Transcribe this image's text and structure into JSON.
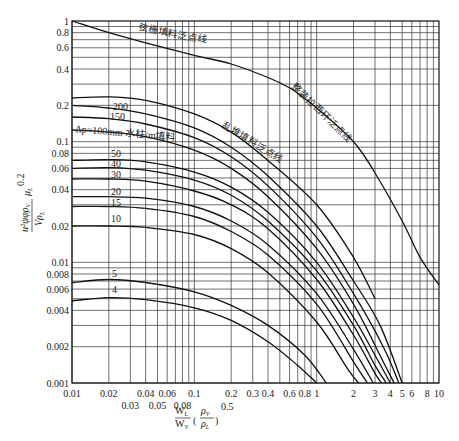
{
  "chart_data": {
    "type": "line",
    "title": "",
    "xscale": "log",
    "yscale": "log",
    "xlim": [
      0.01,
      10
    ],
    "ylim": [
      0.001,
      1
    ],
    "grid": true,
    "xlabel": "W_L/W_V (ρ_V/ρ_L)^0.5",
    "ylabel": "u²ψφρ_V/(gρ_L) μ_L^0.2",
    "x_ticks": [
      0.01,
      0.02,
      0.03,
      0.04,
      0.05,
      0.06,
      0.08,
      0.1,
      0.2,
      0.3,
      0.4,
      0.6,
      0.8,
      1,
      2,
      3,
      4,
      5,
      6,
      8,
      10
    ],
    "x_tick_labels": [
      "0.01",
      "0.02",
      "0.03",
      "0.04",
      "0.05",
      "0.06",
      "0.08",
      "0.1",
      "0.2",
      "0.3",
      "0.4",
      "0.6",
      "0.8",
      "1",
      "2",
      "3",
      "4",
      "5",
      "6",
      "8",
      "10"
    ],
    "y_ticks": [
      1,
      0.8,
      0.6,
      0.4,
      0.2,
      0.1,
      0.08,
      0.06,
      0.04,
      0.02,
      0.01,
      0.008,
      0.006,
      0.004,
      0.002,
      0.001
    ],
    "y_tick_labels": [
      "1",
      "0.8",
      "0.6",
      "0.4",
      "0.2",
      "0.1",
      "0.08",
      "0.06",
      "0.04",
      "0.02",
      "0.01",
      "0.008",
      "0.006",
      "0.004",
      "0.002",
      "0.001"
    ],
    "series": [
      {
        "name": "弦栅填料泛点线",
        "label_text": "弦栅填料泛点线",
        "points": [
          [
            0.01,
            1.0
          ],
          [
            0.02,
            0.8
          ],
          [
            0.04,
            0.66
          ],
          [
            0.1,
            0.52
          ],
          [
            0.2,
            0.44
          ],
          [
            0.4,
            0.34
          ],
          [
            0.6,
            0.28
          ],
          [
            0.75,
            0.24
          ]
        ]
      },
      {
        "name": "整装拉西环泛点线",
        "label_text": "整装拉西环泛点线",
        "points": [
          [
            0.7,
            0.25
          ],
          [
            1,
            0.19
          ],
          [
            2,
            0.1
          ],
          [
            3,
            0.055
          ],
          [
            5,
            0.022
          ],
          [
            7,
            0.011
          ],
          [
            10,
            0.0065
          ]
        ]
      },
      {
        "name": "乱堆填料泛点线",
        "label_text": "乱堆填料泛点线",
        "points": [
          [
            0.01,
            0.23
          ],
          [
            0.02,
            0.235
          ],
          [
            0.04,
            0.22
          ],
          [
            0.1,
            0.17
          ],
          [
            0.2,
            0.12
          ],
          [
            0.4,
            0.07
          ],
          [
            1,
            0.03
          ],
          [
            2,
            0.011
          ],
          [
            3,
            0.005
          ]
        ]
      },
      {
        "name": "Δp=200",
        "label_text": "200",
        "points": [
          [
            0.01,
            0.2
          ],
          [
            0.02,
            0.19
          ],
          [
            0.04,
            0.17
          ],
          [
            0.1,
            0.13
          ],
          [
            0.2,
            0.09
          ],
          [
            0.4,
            0.052
          ],
          [
            1,
            0.02
          ],
          [
            2,
            0.007
          ],
          [
            3.3,
            0.003
          ],
          [
            5,
            0.001
          ]
        ]
      },
      {
        "name": "Δp=150",
        "label_text": "150",
        "points": [
          [
            0.01,
            0.16
          ],
          [
            0.02,
            0.155
          ],
          [
            0.04,
            0.14
          ],
          [
            0.1,
            0.108
          ],
          [
            0.2,
            0.075
          ],
          [
            0.4,
            0.043
          ],
          [
            1,
            0.016
          ],
          [
            2,
            0.0055
          ],
          [
            3.5,
            0.002
          ],
          [
            4.7,
            0.001
          ]
        ]
      },
      {
        "name": "Δp=100",
        "label_text": "Δp=100mm 水柱/m填料",
        "points": [
          [
            0.01,
            0.125
          ],
          [
            0.02,
            0.12
          ],
          [
            0.04,
            0.11
          ],
          [
            0.1,
            0.085
          ],
          [
            0.2,
            0.06
          ],
          [
            0.4,
            0.035
          ],
          [
            1,
            0.013
          ],
          [
            2,
            0.0045
          ],
          [
            3.5,
            0.0015
          ],
          [
            4.3,
            0.001
          ]
        ]
      },
      {
        "name": "Δp=50",
        "label_text": "50",
        "points": [
          [
            0.01,
            0.07
          ],
          [
            0.02,
            0.071
          ],
          [
            0.04,
            0.068
          ],
          [
            0.1,
            0.056
          ],
          [
            0.2,
            0.042
          ],
          [
            0.4,
            0.026
          ],
          [
            1,
            0.01
          ],
          [
            2,
            0.0035
          ],
          [
            3,
            0.0017
          ],
          [
            4,
            0.001
          ]
        ]
      },
      {
        "name": "Δp=40",
        "label_text": "40",
        "points": [
          [
            0.01,
            0.06
          ],
          [
            0.02,
            0.061
          ],
          [
            0.04,
            0.058
          ],
          [
            0.1,
            0.048
          ],
          [
            0.2,
            0.036
          ],
          [
            0.4,
            0.022
          ],
          [
            1,
            0.0085
          ],
          [
            2,
            0.003
          ],
          [
            3,
            0.0014
          ],
          [
            3.7,
            0.001
          ]
        ]
      },
      {
        "name": "Δp=30",
        "label_text": "30",
        "points": [
          [
            0.01,
            0.049
          ],
          [
            0.02,
            0.049
          ],
          [
            0.04,
            0.047
          ],
          [
            0.1,
            0.039
          ],
          [
            0.2,
            0.03
          ],
          [
            0.4,
            0.019
          ],
          [
            1,
            0.0072
          ],
          [
            2,
            0.0025
          ],
          [
            3,
            0.0012
          ],
          [
            3.4,
            0.001
          ]
        ]
      },
      {
        "name": "Δp=20",
        "label_text": "20",
        "points": [
          [
            0.01,
            0.035
          ],
          [
            0.02,
            0.035
          ],
          [
            0.04,
            0.034
          ],
          [
            0.1,
            0.029
          ],
          [
            0.2,
            0.022
          ],
          [
            0.4,
            0.014
          ],
          [
            1,
            0.0055
          ],
          [
            2,
            0.0019
          ],
          [
            2.9,
            0.001
          ]
        ]
      },
      {
        "name": "Δp=15",
        "label_text": "15",
        "points": [
          [
            0.01,
            0.029
          ],
          [
            0.02,
            0.029
          ],
          [
            0.04,
            0.028
          ],
          [
            0.1,
            0.024
          ],
          [
            0.2,
            0.018
          ],
          [
            0.4,
            0.0115
          ],
          [
            1,
            0.0045
          ],
          [
            2,
            0.0015
          ],
          [
            2.6,
            0.001
          ]
        ]
      },
      {
        "name": "Δp=10",
        "label_text": "10",
        "points": [
          [
            0.01,
            0.02
          ],
          [
            0.02,
            0.02
          ],
          [
            0.04,
            0.0195
          ],
          [
            0.1,
            0.017
          ],
          [
            0.2,
            0.013
          ],
          [
            0.4,
            0.0082
          ],
          [
            1,
            0.0032
          ],
          [
            1.8,
            0.0013
          ],
          [
            2.2,
            0.001
          ]
        ]
      },
      {
        "name": "Δp=5",
        "label_text": "5",
        "points": [
          [
            0.01,
            0.0068
          ],
          [
            0.02,
            0.0072
          ],
          [
            0.04,
            0.0068
          ],
          [
            0.1,
            0.0057
          ],
          [
            0.2,
            0.0044
          ],
          [
            0.4,
            0.003
          ],
          [
            0.8,
            0.0017
          ],
          [
            1.2,
            0.001
          ]
        ]
      },
      {
        "name": "Δp=4",
        "label_text": "4",
        "points": [
          [
            0.01,
            0.0048
          ],
          [
            0.02,
            0.0051
          ],
          [
            0.04,
            0.0049
          ],
          [
            0.1,
            0.0042
          ],
          [
            0.2,
            0.0033
          ],
          [
            0.4,
            0.0022
          ],
          [
            0.7,
            0.0014
          ],
          [
            1,
            0.001
          ]
        ]
      }
    ],
    "annotations": [
      "弦栅填料泛点线",
      "整装拉西环泛点线",
      "乱堆填料泛点线",
      "Δp=100mm 水柱/m填料",
      "200",
      "150",
      "50",
      "40",
      "30",
      "20",
      "15",
      "10",
      "5",
      "4"
    ]
  },
  "labels": {
    "x_axis_num": "W",
    "x_axis_num_sub": "L",
    "x_axis_den": "W",
    "x_axis_den_sub": "V",
    "x_axis_rho_num": "ρ",
    "x_axis_rho_num_sub": "V",
    "x_axis_rho_den": "ρ",
    "x_axis_rho_den_sub": "L",
    "x_axis_exp": "0.5",
    "y_axis_num": "u²ψφρ",
    "y_axis_num_sub": "V",
    "y_axis_den": "Vρ",
    "y_axis_den_sub": "L",
    "y_axis_mu": "μ",
    "y_axis_mu_sub": "L",
    "y_axis_exp": "0.2"
  }
}
